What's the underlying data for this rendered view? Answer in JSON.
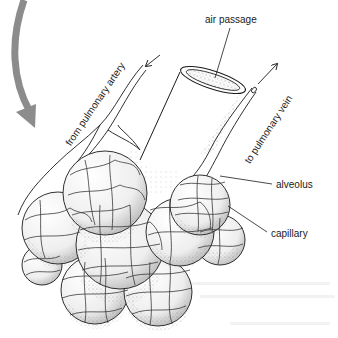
{
  "figure": {
    "labels": {
      "air_passage": "air passage",
      "from_artery": "from pulmonary artery",
      "to_vein": "to pulmonary vein",
      "alveolus": "alveolus",
      "capillary": "capillary"
    },
    "colors": {
      "ink": "#1a1a1a",
      "stipple": "#8a8a8a",
      "curved_arrow": "#8c8c8c",
      "background": "#ffffff"
    },
    "alveoli": [
      {
        "cx": 105,
        "cy": 193,
        "r": 42
      },
      {
        "cx": 58,
        "cy": 228,
        "r": 36
      },
      {
        "cx": 120,
        "cy": 245,
        "r": 44
      },
      {
        "cx": 180,
        "cy": 232,
        "r": 34
      },
      {
        "cx": 200,
        "cy": 205,
        "r": 30
      },
      {
        "cx": 220,
        "cy": 240,
        "r": 25
      },
      {
        "cx": 95,
        "cy": 290,
        "r": 34
      },
      {
        "cx": 158,
        "cy": 292,
        "r": 34
      },
      {
        "cx": 42,
        "cy": 265,
        "r": 20
      }
    ]
  }
}
